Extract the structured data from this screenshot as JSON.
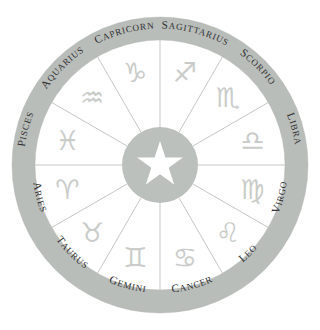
{
  "figure": {
    "center_symbol": "five-pointed-star",
    "background_color": "#ffffff",
    "ring_color": "#b9bdb9",
    "hub_color": "#bcc0bc",
    "glyph_color": "#c9ccc9",
    "label_color": "#2f2f31",
    "spoke_color": "#b9bcb9"
  },
  "chart_data": {
    "type": "pie",
    "xlabel": "",
    "ylabel": "",
    "legend_position": "ring",
    "grid": false,
    "categories": [
      "SAGITTARIUS",
      "SCORPIO",
      "LIBRA",
      "VIRGO",
      "LEO",
      "CANCER",
      "GEMINI",
      "TAURUS",
      "ARIES",
      "PISCES",
      "AQUARIUS",
      "CAPRICORN"
    ],
    "values": [
      30,
      30,
      30,
      30,
      30,
      30,
      30,
      30,
      30,
      30,
      30,
      30
    ],
    "units": "degrees"
  },
  "wheel": {
    "segment_count": 12,
    "segments": [
      {
        "label": "SAGITTARIUS",
        "glyph": "♐",
        "center_angle_deg": -75,
        "order": 1
      },
      {
        "label": "SCORPIO",
        "glyph": "♏",
        "center_angle_deg": -45,
        "order": 2
      },
      {
        "label": "LIBRA",
        "glyph": "♎",
        "center_angle_deg": -15,
        "order": 3
      },
      {
        "label": "VIRGO",
        "glyph": "♍",
        "center_angle_deg": 15,
        "order": 4
      },
      {
        "label": "LEO",
        "glyph": "♌",
        "center_angle_deg": 45,
        "order": 5
      },
      {
        "label": "CANCER",
        "glyph": "♋",
        "center_angle_deg": 75,
        "order": 6
      },
      {
        "label": "GEMINI",
        "glyph": "♊",
        "center_angle_deg": 105,
        "order": 7
      },
      {
        "label": "TAURUS",
        "glyph": "♉",
        "center_angle_deg": 135,
        "order": 8
      },
      {
        "label": "ARIES",
        "glyph": "♈",
        "center_angle_deg": 165,
        "order": 9
      },
      {
        "label": "PISCES",
        "glyph": "♓",
        "center_angle_deg": 195,
        "order": 10
      },
      {
        "label": "AQUARIUS",
        "glyph": "♒",
        "center_angle_deg": 225,
        "order": 11
      },
      {
        "label": "CAPRICORN",
        "glyph": "♑",
        "center_angle_deg": 255,
        "order": 12
      }
    ]
  }
}
